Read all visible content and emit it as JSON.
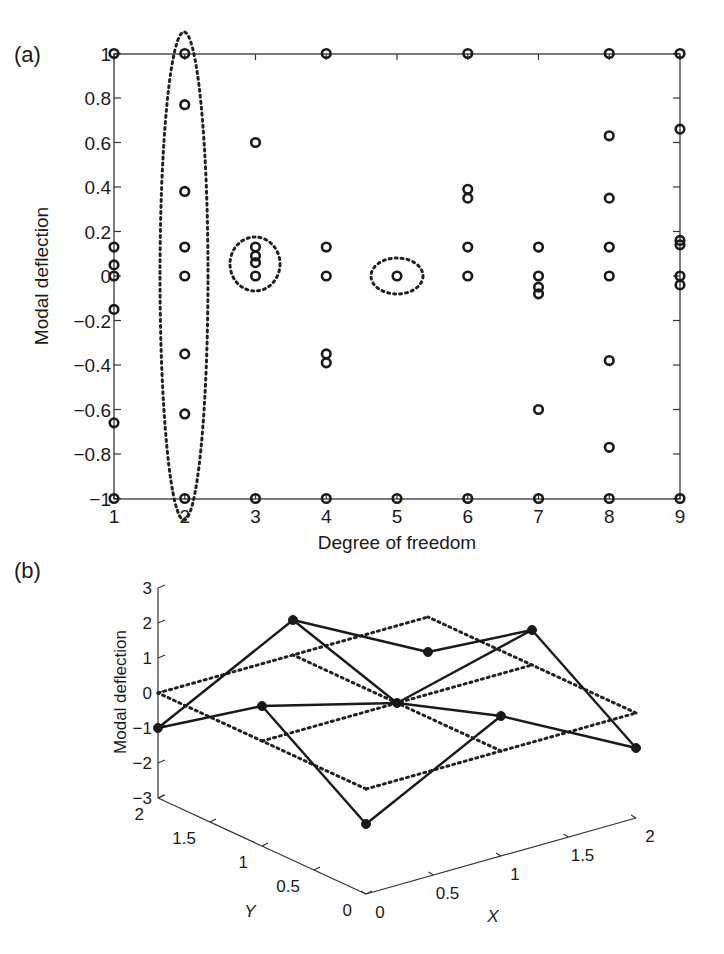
{
  "panels": {
    "a": {
      "label": "(a)"
    },
    "b": {
      "label": "(b)"
    }
  },
  "colors": {
    "ink": "#1a1a1a",
    "background": "#ffffff"
  },
  "chart_data": [
    {
      "type": "scatter",
      "panel": "(a)",
      "title": "",
      "xlabel": "Degree of freedom",
      "ylabel": "Modal deflection",
      "xlim": [
        1,
        9
      ],
      "ylim": [
        -1,
        1
      ],
      "xticks": [
        "1",
        "2",
        "3",
        "4",
        "5",
        "6",
        "7",
        "8",
        "9"
      ],
      "yticks": [
        "-1",
        "-0.8",
        "-0.6",
        "-0.4",
        "-0.2",
        "0",
        "0.2",
        "0.4",
        "0.6",
        "0.8",
        "1"
      ],
      "grid": false,
      "marker": "open circle",
      "points_by_dof": [
        {
          "x": 1,
          "y": [
            1,
            0.13,
            0.05,
            0.0,
            -0.15,
            -0.66,
            -1
          ]
        },
        {
          "x": 2,
          "y": [
            1,
            0.77,
            0.38,
            0.13,
            0.0,
            -0.35,
            -0.62,
            -1
          ]
        },
        {
          "x": 3,
          "y": [
            0.6,
            0.13,
            0.09,
            0.06,
            0.0,
            -1
          ]
        },
        {
          "x": 4,
          "y": [
            1,
            0.13,
            0.0,
            -0.35,
            -0.39,
            -1
          ]
        },
        {
          "x": 5,
          "y": [
            0.0,
            -1
          ]
        },
        {
          "x": 6,
          "y": [
            1,
            0.39,
            0.35,
            0.13,
            0.0,
            -1
          ]
        },
        {
          "x": 7,
          "y": [
            0.13,
            0.0,
            -0.05,
            -0.08,
            -0.6,
            -1
          ]
        },
        {
          "x": 8,
          "y": [
            1,
            0.63,
            0.35,
            0.13,
            0.0,
            -0.38,
            -0.77,
            -1
          ]
        },
        {
          "x": 9,
          "y": [
            1,
            0.66,
            0.16,
            0.14,
            0.0,
            -0.04,
            -1
          ]
        }
      ],
      "annotations": [
        {
          "type": "dotted ellipse",
          "around": "all points at DOF 2"
        },
        {
          "type": "dotted circle",
          "around": "cluster at DOF 3 near 0 to 0.13"
        },
        {
          "type": "dotted ellipse",
          "around": "point at DOF 5, y=0"
        }
      ]
    },
    {
      "type": "line3d",
      "panel": "(b)",
      "xlabel": "X",
      "ylabel": "Y",
      "zlabel": "Modal deflection",
      "xticks": [
        "0",
        "0.5",
        "1",
        "1.5",
        "2"
      ],
      "yticks": [
        "0",
        "0.5",
        "1",
        "1.5",
        "2"
      ],
      "zticks": [
        "-3",
        "-2",
        "-1",
        "0",
        "1",
        "2",
        "3"
      ],
      "xlim": [
        0,
        2
      ],
      "ylim": [
        0,
        2
      ],
      "zlim": [
        -3,
        3
      ],
      "series": [
        {
          "name": "undeformed grid",
          "style": "dotted",
          "grid": "3x3 nodes at z=0"
        },
        {
          "name": "mode shape",
          "style": "solid with filled markers",
          "nodes": [
            {
              "x": 0,
              "y": 2,
              "z": -1
            },
            {
              "x": 0,
              "y": 1,
              "z": 1
            },
            {
              "x": 0,
              "y": 0,
              "z": -1
            },
            {
              "x": 1,
              "y": 2,
              "z": 1
            },
            {
              "x": 1,
              "y": 1,
              "z": 0
            },
            {
              "x": 1,
              "y": 0,
              "z": 1
            },
            {
              "x": 2,
              "y": 2,
              "z": -1
            },
            {
              "x": 2,
              "y": 1,
              "z": 1
            },
            {
              "x": 2,
              "y": 0,
              "z": -1
            }
          ]
        }
      ]
    }
  ]
}
